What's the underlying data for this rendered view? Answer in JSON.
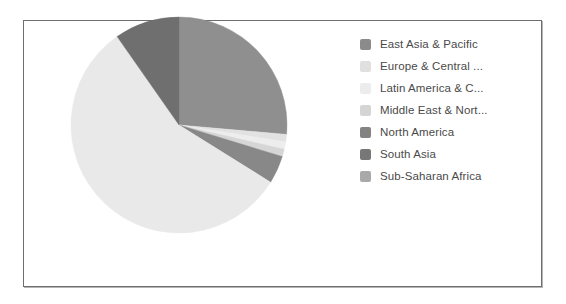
{
  "frame": {
    "border_color": "#6e6e6e",
    "background": "#ffffff"
  },
  "chart_data": {
    "type": "pie",
    "title": "",
    "subtitle": "",
    "xlabel": "",
    "ylabel": "",
    "grid": false,
    "legend_position": "right",
    "legend_truncation": "...",
    "categories": [
      "East Asia & Pacific",
      "Europe & Central ...",
      "Latin America & C...",
      "Middle East & Nort...",
      "North America",
      "South Asia",
      "Sub-Saharan Africa"
    ],
    "values": [
      26.4,
      1.1,
      1.1,
      1.1,
      4.2,
      9.7,
      56.4
    ],
    "colors": [
      "#8f8f8f",
      "#e2e2e2",
      "#ededed",
      "#d6d6d6",
      "#888888",
      "#7e7e7e",
      "#b0b0b0"
    ],
    "slices": [
      {
        "label": "East Asia & Pacific",
        "value": 26.4,
        "color": "#8f8f8f",
        "start_angle": 0,
        "end_angle": 95
      },
      {
        "label": "Europe & Central ...",
        "value": 1.1,
        "color": "#e2e2e2",
        "start_angle": 95,
        "end_angle": 99
      },
      {
        "label": "Latin America & C...",
        "value": 1.1,
        "color": "#ededed",
        "start_angle": 99,
        "end_angle": 103
      },
      {
        "label": "Middle East & Nort...",
        "value": 1.1,
        "color": "#d6d6d6",
        "start_angle": 103,
        "end_angle": 107
      },
      {
        "label": "North America",
        "value": 4.2,
        "color": "#888888",
        "start_angle": 107,
        "end_angle": 122
      },
      {
        "label": "Sub-Saharan Africa",
        "value": 56.4,
        "color": "#e9e9e9",
        "start_angle": 122,
        "end_angle": 325
      },
      {
        "label": "South Asia",
        "value": 9.7,
        "color": "#6f6f6f",
        "start_angle": 325,
        "end_angle": 360
      }
    ],
    "center": {
      "x": 110,
      "y": 110
    },
    "radius": 108
  },
  "legend": {
    "items": [
      {
        "label": "East Asia & Pacific",
        "color": "#8b8b8b",
        "name": "east-asia-pacific"
      },
      {
        "label": "Europe & Central ...",
        "color": "#e0e0e0",
        "name": "europe-central-asia"
      },
      {
        "label": "Latin America & C...",
        "color": "#ececec",
        "name": "latin-america-caribbean"
      },
      {
        "label": "Middle East & Nort...",
        "color": "#d5d5d5",
        "name": "middle-east-north-africa"
      },
      {
        "label": "North America",
        "color": "#838383",
        "name": "north-america"
      },
      {
        "label": "South Asia",
        "color": "#777777",
        "name": "south-asia"
      },
      {
        "label": "Sub-Saharan Africa",
        "color": "#a9a9a9",
        "name": "sub-saharan-africa"
      }
    ]
  }
}
